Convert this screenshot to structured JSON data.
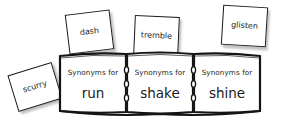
{
  "illustration": {
    "title": "Synonyms thesaurus book with sticky notes",
    "background_color": "#ffffff",
    "ink_color": "#1b1b1b"
  },
  "book": {
    "panels": [
      {
        "label": "Synonyms for",
        "word": "run"
      },
      {
        "label": "Synonyms for",
        "word": "shake"
      },
      {
        "label": "Synonyms for",
        "word": "shine"
      }
    ]
  },
  "notes": [
    {
      "text": "scurry"
    },
    {
      "text": "dash"
    },
    {
      "text": "tremble"
    },
    {
      "text": "glisten"
    }
  ]
}
